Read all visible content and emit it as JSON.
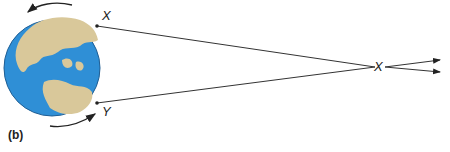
{
  "diagram": {
    "panel_label": "(b)",
    "point_top_label": "X",
    "point_bottom_label": "Y",
    "convergence_label": "X",
    "colors": {
      "ocean": "#2f8fd6",
      "land": "#d9c89a",
      "lines": "#333333",
      "arrows": "#222222"
    }
  }
}
